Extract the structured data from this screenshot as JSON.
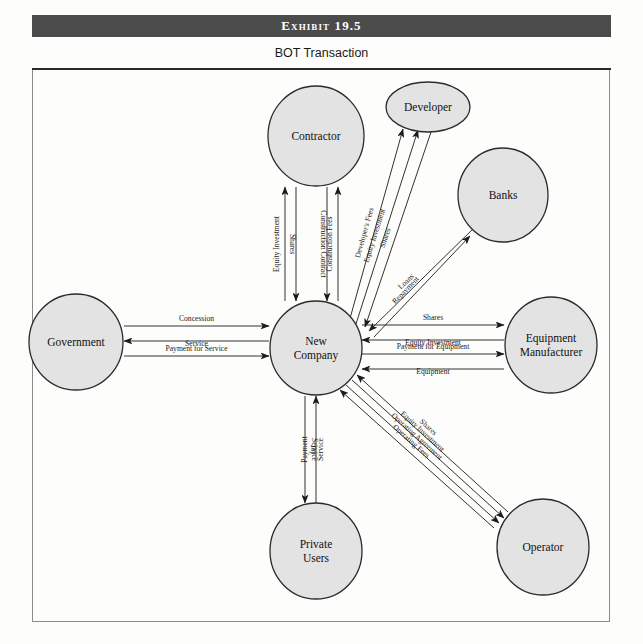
{
  "header": {
    "exhibit_label": "Exhibit 19.5",
    "subtitle": "BOT Transaction",
    "band_color": "#4b4b4b"
  },
  "diagram": {
    "type": "node-link",
    "node_fill": "#e3e3e3",
    "node_stroke": "#2b2b2b",
    "nodes": [
      {
        "id": "contractor",
        "label": "Contractor",
        "label_lines": [
          "Contractor"
        ],
        "cx": 316,
        "cy": 136,
        "rx": 48,
        "ry": 50
      },
      {
        "id": "developer",
        "label": "Developer",
        "label_lines": [
          "Developer"
        ],
        "cx": 428,
        "cy": 107,
        "rx": 42,
        "ry": 25
      },
      {
        "id": "banks",
        "label": "Banks",
        "label_lines": [
          "Banks"
        ],
        "cx": 503,
        "cy": 195,
        "rx": 45,
        "ry": 47
      },
      {
        "id": "government",
        "label": "Government",
        "label_lines": [
          "Government"
        ],
        "cx": 76,
        "cy": 342,
        "rx": 47,
        "ry": 48
      },
      {
        "id": "newcompany",
        "label": "New Company",
        "label_lines": [
          "New",
          "Company"
        ],
        "cx": 316,
        "cy": 348,
        "rx": 46,
        "ry": 47
      },
      {
        "id": "equipment",
        "label": "Equipment Manufacturer",
        "label_lines": [
          "Equipment",
          "Manufacturer"
        ],
        "cx": 551,
        "cy": 345,
        "rx": 46,
        "ry": 48
      },
      {
        "id": "privateusers",
        "label": "Private Users",
        "label_lines": [
          "Private",
          "Users"
        ],
        "cx": 316,
        "cy": 551,
        "rx": 46,
        "ry": 48
      },
      {
        "id": "operator",
        "label": "Operator",
        "label_lines": [
          "Operator"
        ],
        "cx": 543,
        "cy": 547,
        "rx": 46,
        "ry": 48
      }
    ],
    "edges": [
      {
        "id": "e1",
        "label": "Equity Investment",
        "from": "newcompany",
        "to": "contractor",
        "direction": "up"
      },
      {
        "id": "e2",
        "label": "Shares",
        "from": "contractor",
        "to": "newcompany",
        "direction": "down"
      },
      {
        "id": "e3",
        "label": "Construction Contract",
        "from": "contractor",
        "to": "newcompany",
        "direction": "down"
      },
      {
        "id": "e4",
        "label": "Construction Fees",
        "from": "newcompany",
        "to": "contractor",
        "direction": "up"
      },
      {
        "id": "e5",
        "label": "Developer's Fees",
        "from": "newcompany",
        "to": "developer",
        "direction": "up-right"
      },
      {
        "id": "e6",
        "label": "Equity Investment",
        "from": "newcompany",
        "to": "developer",
        "direction": "up-right"
      },
      {
        "id": "e7",
        "label": "Shares",
        "from": "developer",
        "to": "newcompany",
        "direction": "down-left"
      },
      {
        "id": "e8",
        "label": "Loans",
        "from": "banks",
        "to": "newcompany",
        "direction": "down-left"
      },
      {
        "id": "e9",
        "label": "Repayment",
        "from": "newcompany",
        "to": "banks",
        "direction": "up-right"
      },
      {
        "id": "e10",
        "label": "Concession",
        "from": "government",
        "to": "newcompany",
        "direction": "right"
      },
      {
        "id": "e11",
        "label": "Service",
        "from": "newcompany",
        "to": "government",
        "direction": "left"
      },
      {
        "id": "e12",
        "label": "Payment for Service",
        "from": "government",
        "to": "newcompany",
        "direction": "right"
      },
      {
        "id": "e13",
        "label": "Shares",
        "from": "newcompany",
        "to": "equipment",
        "direction": "right"
      },
      {
        "id": "e14",
        "label": "Equity Investment",
        "from": "equipment",
        "to": "newcompany",
        "direction": "left"
      },
      {
        "id": "e15",
        "label": "Payment for Equipment",
        "from": "newcompany",
        "to": "equipment",
        "direction": "right"
      },
      {
        "id": "e16",
        "label": "Equipment",
        "from": "equipment",
        "to": "newcompany",
        "direction": "left"
      },
      {
        "id": "e17",
        "label": "Service",
        "from": "newcompany",
        "to": "privateusers",
        "direction": "down"
      },
      {
        "id": "e18",
        "label": "Payment for Service",
        "label_lines": [
          "Payment",
          "for",
          "Service"
        ],
        "from": "privateusers",
        "to": "newcompany",
        "direction": "up"
      },
      {
        "id": "e19",
        "label": "Shares",
        "from": "operator",
        "to": "newcompany",
        "direction": "up-left"
      },
      {
        "id": "e20",
        "label": "Equity Investment",
        "from": "newcompany",
        "to": "operator",
        "direction": "down-right"
      },
      {
        "id": "e21",
        "label": "Operating Agreement",
        "from": "newcompany",
        "to": "operator",
        "direction": "down-right"
      },
      {
        "id": "e22",
        "label": "Operating Fees",
        "from": "operator",
        "to": "newcompany",
        "direction": "up-left"
      }
    ]
  }
}
